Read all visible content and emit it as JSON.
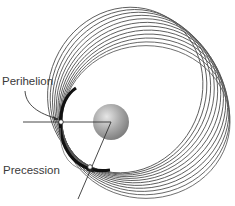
{
  "diagram": {
    "labels": {
      "perihelion": "Perihelion",
      "precession": "Precession"
    },
    "sun": {
      "cx": 111,
      "cy": 122,
      "r": 18,
      "color_light": "#e6e6e6",
      "color_mid": "#a8a8a8",
      "color_dark": "#7a7a7a"
    },
    "orbits": {
      "count": 12,
      "perihelion_distance": 49,
      "aphelion_distance": 119,
      "start_angle_deg": 0,
      "end_angle_deg": -66,
      "stroke": "#555555"
    },
    "reference_lines": {
      "horizontal": {
        "x1": 23,
        "y1": 122,
        "x2": 111,
        "y2": 122
      },
      "tilted": {
        "x1": 111,
        "y1": 122,
        "x2": 78,
        "y2": 199
      },
      "color": "#333333"
    },
    "perihelion_markers": [
      {
        "x": 61,
        "y": 122
      },
      {
        "x": 90,
        "y": 167
      }
    ],
    "colors": {
      "text": "#3a3a3a",
      "arc": "#888888"
    }
  }
}
